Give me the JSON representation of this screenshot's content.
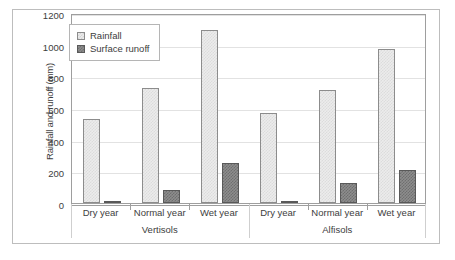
{
  "chart_data": {
    "type": "bar",
    "title": "",
    "xlabel": "",
    "ylabel": "Rainfall and runoff (mm)",
    "ylim": [
      0,
      1200
    ],
    "ytick_step": 200,
    "yticks": [
      1200,
      1000,
      800,
      600,
      400,
      200,
      0
    ],
    "grid": true,
    "legend_position": "top-left inside plot",
    "categories": [
      "Dry year",
      "Normal year",
      "Wet year",
      "Dry year",
      "Normal year",
      "Wet year"
    ],
    "groups": [
      {
        "name": "Vertisols",
        "categories": [
          "Dry year",
          "Normal year",
          "Wet year"
        ]
      },
      {
        "name": "Alfisols",
        "categories": [
          "Dry year",
          "Normal year",
          "Wet year"
        ]
      }
    ],
    "series": [
      {
        "name": "Rainfall",
        "color": "#ececec",
        "values": [
          530,
          725,
          1095,
          570,
          715,
          975
        ]
      },
      {
        "name": "Surface runoff",
        "color": "#8d8d8d",
        "values": [
          10,
          80,
          255,
          8,
          125,
          210
        ]
      }
    ]
  },
  "legend": {
    "items": [
      {
        "label": "Rainfall",
        "swatch": "rainfall"
      },
      {
        "label": "Surface runoff",
        "swatch": "runoff"
      }
    ]
  }
}
